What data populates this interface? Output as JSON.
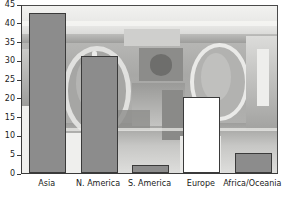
{
  "chart_data": {
    "type": "bar",
    "title": "",
    "subtitle": "",
    "xlabel": "",
    "ylabel": "",
    "categories": [
      "Asia",
      "N. America",
      "S. America",
      "Europe",
      "Africa/Oceania"
    ],
    "values": [
      42.5,
      31.2,
      2.2,
      20.2,
      5.2
    ],
    "series": [
      {
        "name": "Share (%)",
        "values": [
          42.5,
          31.2,
          2.2,
          20.2,
          5.2
        ]
      }
    ],
    "bar_styles": [
      "filled",
      "filled",
      "filled",
      "hollow",
      "filled"
    ],
    "ylim": [
      0,
      45
    ],
    "yticks": [
      0,
      5,
      10,
      15,
      20,
      25,
      30,
      35,
      40,
      45
    ],
    "ytick_labels": [
      "0",
      "5",
      "10",
      "15",
      "20",
      "25",
      "30",
      "35",
      "40",
      "45"
    ],
    "grid": false,
    "legend": null,
    "annotations": [],
    "background": "blurred grayscale photograph",
    "colors": {
      "bar_fill": "#8c8c8c",
      "bar_hollow": "#ffffff",
      "bar_edge": "#3a3a3a",
      "axis": "#3a3a3a",
      "tick_label": "#1a1a1a",
      "plot_background": "#cfcfcf",
      "figure_background": "#ffffff"
    }
  },
  "axes": {
    "y_tick_labels": [
      "45",
      "40",
      "35",
      "30",
      "25",
      "20",
      "15",
      "10",
      "5",
      "0"
    ],
    "x_tick_labels": [
      "Asia",
      "N. America",
      "S. America",
      "Europe",
      "Africa/Oceania"
    ]
  }
}
